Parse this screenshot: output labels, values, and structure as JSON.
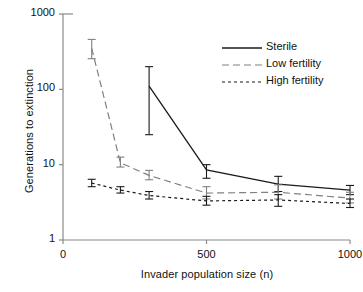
{
  "chart_data": {
    "type": "line",
    "title": "",
    "xlabel": "Invader population size (n)",
    "ylabel": "Generations to extinction",
    "xlim": [
      0,
      1000
    ],
    "ylim": [
      1,
      1000
    ],
    "yscale": "log",
    "grid": false,
    "legend_position": "top-right",
    "xticks": [
      "0",
      "500",
      "1000"
    ],
    "xtick_values": [
      0,
      500,
      1000
    ],
    "yticks": [
      "1",
      "10",
      "100",
      "1000"
    ],
    "ytick_values": [
      1,
      10,
      100,
      1000
    ],
    "x": [
      100,
      200,
      300,
      500,
      750,
      1000
    ],
    "series": [
      {
        "name": "Sterile",
        "style": "solid",
        "color": "#1a1a1a",
        "x": [
          300,
          500,
          750,
          1000
        ],
        "values": [
          110,
          8.5,
          5.5,
          4.6
        ],
        "err_low": [
          25,
          6.6,
          4.4,
          4.0
        ],
        "err_high": [
          200,
          10.0,
          7.0,
          5.3
        ]
      },
      {
        "name": "Low fertility",
        "style": "long-dash",
        "color": "#808080",
        "x": [
          100,
          200,
          300,
          500,
          750,
          1000
        ],
        "values": [
          350,
          10.6,
          7.2,
          4.2,
          4.3,
          3.6
        ],
        "err_low": [
          255,
          9.3,
          6.3,
          3.5,
          3.5,
          3.1
        ],
        "err_high": [
          460,
          12.6,
          8.4,
          5.1,
          5.4,
          4.3
        ]
      },
      {
        "name": "High fertility",
        "style": "short-dash",
        "color": "#1a1a1a",
        "x": [
          100,
          200,
          300,
          500,
          750,
          1000
        ],
        "values": [
          5.7,
          4.6,
          3.9,
          3.3,
          3.4,
          3.05
        ],
        "err_low": [
          5.1,
          4.2,
          3.5,
          2.9,
          2.8,
          2.7
        ],
        "err_high": [
          6.4,
          5.1,
          4.4,
          3.8,
          4.0,
          3.5
        ]
      }
    ],
    "legend": [
      {
        "label": "Sterile",
        "style": "solid"
      },
      {
        "label": "Low fertility",
        "style": "long-dash"
      },
      {
        "label": "High fertility",
        "style": "short-dash"
      }
    ]
  }
}
